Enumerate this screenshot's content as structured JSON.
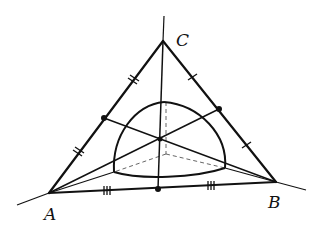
{
  "diagram": {
    "type": "geometry",
    "labels": {
      "A": "A",
      "B": "B",
      "C": "C"
    },
    "points": {
      "A": [
        49,
        193
      ],
      "B": [
        276,
        182
      ],
      "C": [
        163,
        41
      ],
      "mid_AB": [
        158,
        189
      ],
      "mid_AC": [
        104,
        118
      ],
      "mid_BC": [
        219,
        109
      ],
      "centroid": [
        160,
        139
      ],
      "dome_top": [
        164,
        102
      ],
      "dome_left": [
        114,
        172
      ],
      "dome_right": [
        225,
        168
      ],
      "dome_center": [
        166,
        154
      ]
    },
    "tick_marks": {
      "AC": "double",
      "BC": "single",
      "AB": "triple"
    },
    "colors": {
      "ink": "#111111",
      "dashed": "#555555",
      "background": "#ffffff"
    }
  }
}
